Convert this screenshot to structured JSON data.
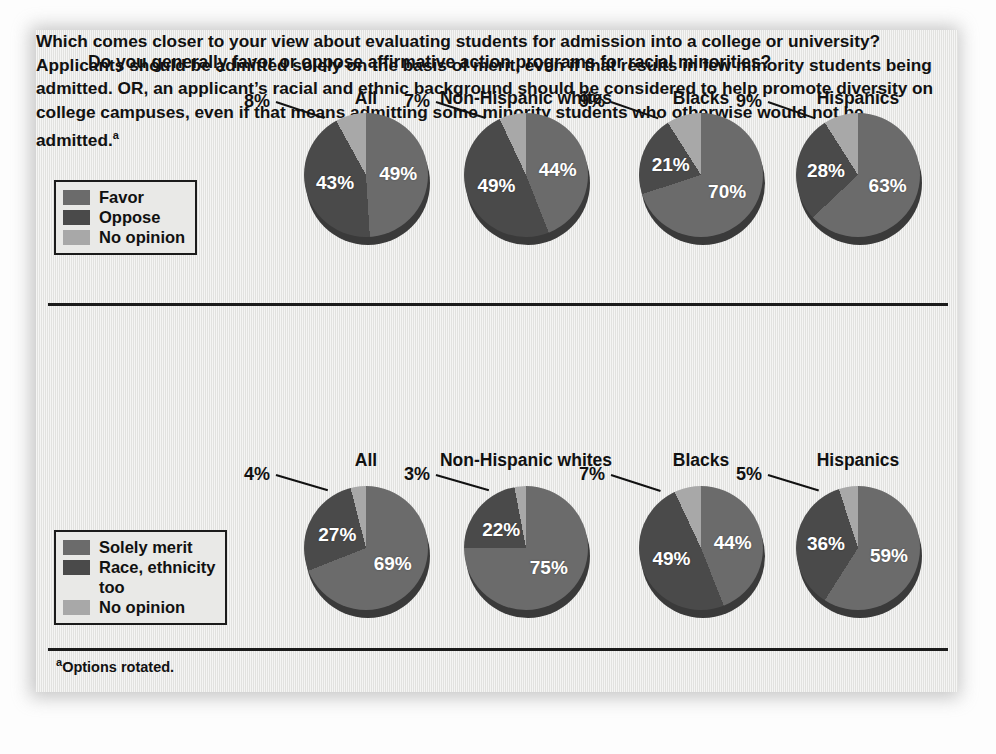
{
  "figure": {
    "background_color": "#e9e9e7",
    "footnote": "Options rotated.",
    "footnote_marker": "a"
  },
  "colors": {
    "favor": "#6b6b6b",
    "oppose": "#4a4a4a",
    "no_opinion": "#a8a8a8",
    "solely_merit": "#6b6b6b",
    "race_ethnicity": "#4a4a4a",
    "no_opinion_2": "#a8a8a8",
    "text": "#111111",
    "label_text": "#ffffff"
  },
  "sections": [
    {
      "id": "affirmative-action",
      "title": "Do you generally favor or oppose affirmative action programs for racial minorities?",
      "legend": [
        {
          "label": "Favor",
          "color": "#6b6b6b"
        },
        {
          "label": "Oppose",
          "color": "#4a4a4a"
        },
        {
          "label": "No opinion",
          "color": "#a8a8a8"
        }
      ],
      "columns": [
        "All",
        "Non-Hispanic whites",
        "Blacks",
        "Hispanics"
      ],
      "pies": [
        {
          "group": "All",
          "favor": "49%",
          "oppose": "43%",
          "no_opinion": "8%"
        },
        {
          "group": "Non-Hispanic whites",
          "favor": "44%",
          "oppose": "49%",
          "no_opinion": "7%"
        },
        {
          "group": "Blacks",
          "favor": "70%",
          "oppose": "21%",
          "no_opinion": "9%"
        },
        {
          "group": "Hispanics",
          "favor": "63%",
          "oppose": "28%",
          "no_opinion": "9%"
        }
      ]
    },
    {
      "id": "college-admission",
      "title": "Which comes closer to your view about evaluating students for admission into a college or university? Applicants should be admitted solely on the basis of merit, even if that results in few minority students being admitted. OR, an applicant’s racial and ethnic background should be considered to help promote diversity on college campuses, even if that means admitting some minority students who otherwise would not be admitted.",
      "title_footnote_marker": "a",
      "legend": [
        {
          "label": "Solely merit",
          "color": "#6b6b6b"
        },
        {
          "label": "Race, ethnicity",
          "color": "#4a4a4a"
        },
        {
          "label": "too",
          "color": null
        },
        {
          "label": "No opinion",
          "color": "#a8a8a8"
        }
      ],
      "columns": [
        "All",
        "Non-Hispanic whites",
        "Blacks",
        "Hispanics"
      ],
      "pies": [
        {
          "group": "All",
          "solely_merit": "69%",
          "race_ethnicity": "27%",
          "no_opinion": "4%"
        },
        {
          "group": "Non-Hispanic whites",
          "solely_merit": "75%",
          "race_ethnicity": "22%",
          "no_opinion": "3%"
        },
        {
          "group": "Blacks",
          "solely_merit": "44%",
          "race_ethnicity": "49%",
          "no_opinion": "7%"
        },
        {
          "group": "Hispanics",
          "solely_merit": "59%",
          "race_ethnicity": "36%",
          "no_opinion": "5%"
        }
      ]
    }
  ],
  "chart_data": [
    {
      "type": "pie",
      "title": "Do you generally favor or oppose affirmative action programs for racial minorities?",
      "legend": [
        "Favor",
        "Oppose",
        "No opinion"
      ],
      "legend_position": "left",
      "units": "percent",
      "groups": [
        {
          "name": "All",
          "labels": [
            "Favor",
            "Oppose",
            "No opinion"
          ],
          "values": [
            49,
            43,
            8
          ]
        },
        {
          "name": "Non-Hispanic whites",
          "labels": [
            "Favor",
            "Oppose",
            "No opinion"
          ],
          "values": [
            44,
            49,
            7
          ]
        },
        {
          "name": "Blacks",
          "labels": [
            "Favor",
            "Oppose",
            "No opinion"
          ],
          "values": [
            70,
            21,
            9
          ]
        },
        {
          "name": "Hispanics",
          "labels": [
            "Favor",
            "Oppose",
            "No opinion"
          ],
          "values": [
            63,
            28,
            9
          ]
        }
      ]
    },
    {
      "type": "pie",
      "title": "Which comes closer to your view about evaluating students for admission into a college or university? Applicants should be admitted solely on the basis of merit, even if that results in few minority students being admitted. OR, an applicant’s racial and ethnic background should be considered to help promote diversity on college campuses, even if that means admitting some minority students who otherwise would not be admitted.",
      "legend": [
        "Solely merit",
        "Race, ethnicity too",
        "No opinion"
      ],
      "legend_position": "left",
      "units": "percent",
      "groups": [
        {
          "name": "All",
          "labels": [
            "Solely merit",
            "Race, ethnicity too",
            "No opinion"
          ],
          "values": [
            69,
            27,
            4
          ]
        },
        {
          "name": "Non-Hispanic whites",
          "labels": [
            "Solely merit",
            "Race, ethnicity too",
            "No opinion"
          ],
          "values": [
            75,
            22,
            3
          ]
        },
        {
          "name": "Blacks",
          "labels": [
            "Solely merit",
            "Race, ethnicity too",
            "No opinion"
          ],
          "values": [
            44,
            49,
            7
          ]
        },
        {
          "name": "Hispanics",
          "labels": [
            "Solely merit",
            "Race, ethnicity too",
            "No opinion"
          ],
          "values": [
            59,
            36,
            5
          ]
        }
      ]
    }
  ]
}
